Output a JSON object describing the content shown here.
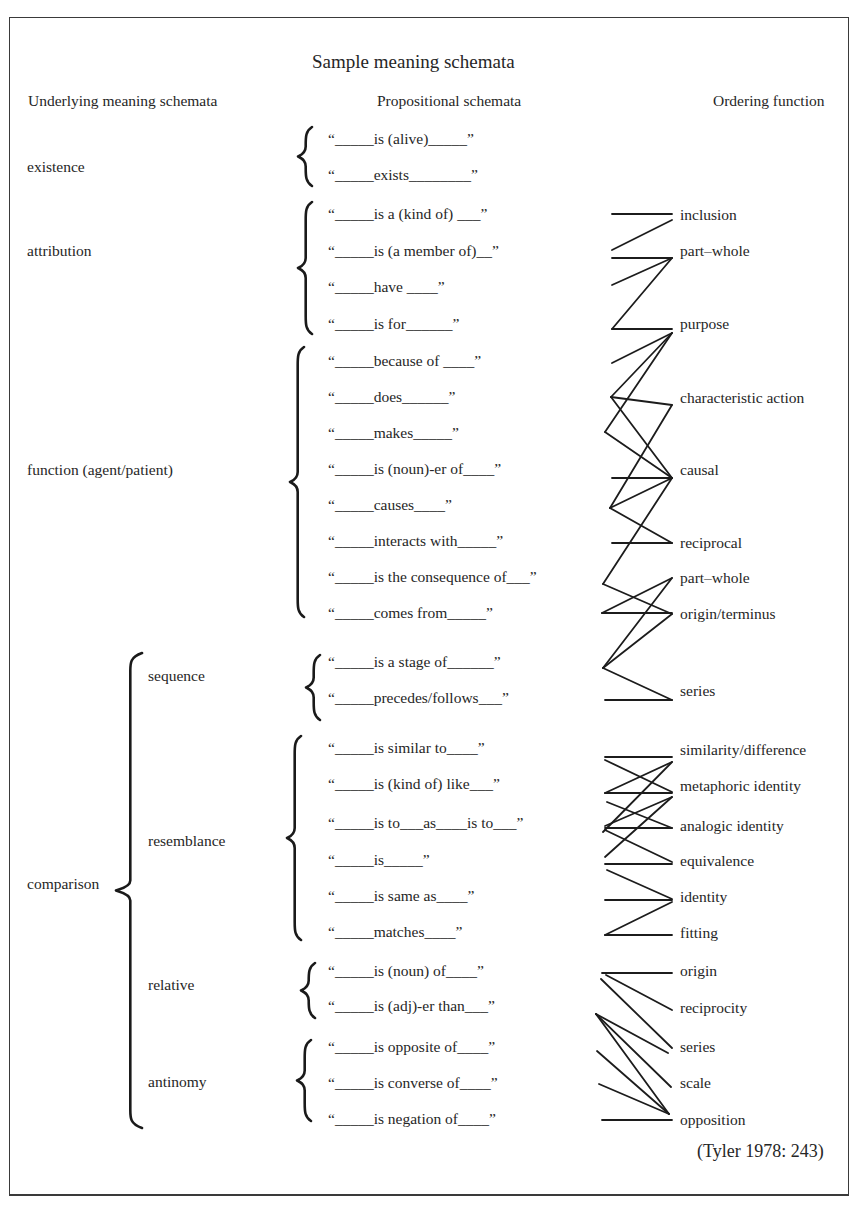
{
  "title": "Sample meaning schemata",
  "headers": {
    "underlying": "Underlying meaning schemata",
    "propositional": "Propositional schemata",
    "ordering": "Ordering function"
  },
  "underlying": [
    {
      "label": "existence",
      "x": 27,
      "y": 158
    },
    {
      "label": "attribution",
      "x": 27,
      "y": 242
    },
    {
      "label": "function (agent/patient)",
      "x": 27,
      "y": 461
    },
    {
      "label": "comparison",
      "x": 27,
      "y": 875
    },
    {
      "label": "sequence",
      "x": 148,
      "y": 667
    },
    {
      "label": "resemblance",
      "x": 148,
      "y": 832
    },
    {
      "label": "relative",
      "x": 148,
      "y": 976
    },
    {
      "label": "antinomy",
      "x": 148,
      "y": 1073
    }
  ],
  "propositional": [
    {
      "text": "“_____is (alive)_____”",
      "y": 130
    },
    {
      "text": "“_____exists________”",
      "y": 166
    },
    {
      "text": "“_____is a (kind of) ___”",
      "y": 205
    },
    {
      "text": "“_____is (a member of)__”",
      "y": 242
    },
    {
      "text": "“_____have ____”",
      "y": 278
    },
    {
      "text": "“_____is for______”",
      "y": 315
    },
    {
      "text": "“_____because of ____”",
      "y": 352
    },
    {
      "text": "“_____does______”",
      "y": 388
    },
    {
      "text": "“_____makes_____”",
      "y": 424
    },
    {
      "text": "“_____is (noun)-er of____”",
      "y": 460
    },
    {
      "text": "“_____causes____”",
      "y": 496
    },
    {
      "text": "“_____interacts with_____”",
      "y": 532
    },
    {
      "text": "“_____is the consequence of___”",
      "y": 568
    },
    {
      "text": "“_____comes from_____”",
      "y": 604
    },
    {
      "text": "“_____is a stage of______”",
      "y": 653
    },
    {
      "text": "“_____precedes/follows___”",
      "y": 689
    },
    {
      "text": "“_____is similar to____”",
      "y": 739
    },
    {
      "text": "“_____is (kind of) like___”",
      "y": 775
    },
    {
      "text": "“_____is to___as____is to___”",
      "y": 814
    },
    {
      "text": "“_____is_____”",
      "y": 851
    },
    {
      "text": "“_____is same as____”",
      "y": 887
    },
    {
      "text": "“_____matches____”",
      "y": 923
    },
    {
      "text": "“_____is (noun) of____”",
      "y": 962
    },
    {
      "text": "“_____is (adj)-er than___”",
      "y": 997
    },
    {
      "text": "“_____is opposite of____”",
      "y": 1038
    },
    {
      "text": "“_____is converse of____”",
      "y": 1074
    },
    {
      "text": "“_____is negation of____”",
      "y": 1110
    }
  ],
  "ordering": [
    {
      "label": "inclusion",
      "y": 206
    },
    {
      "label": "part–whole",
      "y": 242
    },
    {
      "label": "purpose",
      "y": 315
    },
    {
      "label": "characteristic action",
      "y": 389
    },
    {
      "label": "causal",
      "y": 461
    },
    {
      "label": "reciprocal",
      "y": 534
    },
    {
      "label": "part–whole",
      "y": 569
    },
    {
      "label": "origin/terminus",
      "y": 605
    },
    {
      "label": "series",
      "y": 682
    },
    {
      "label": "similarity/difference",
      "y": 741
    },
    {
      "label": "metaphoric identity",
      "y": 777
    },
    {
      "label": "analogic identity",
      "y": 817
    },
    {
      "label": "equivalence",
      "y": 852
    },
    {
      "label": "identity",
      "y": 888
    },
    {
      "label": "fitting",
      "y": 924
    },
    {
      "label": "origin",
      "y": 962
    },
    {
      "label": "reciprocity",
      "y": 999
    },
    {
      "label": "series",
      "y": 1038
    },
    {
      "label": "scale",
      "y": 1074
    },
    {
      "label": "opposition",
      "y": 1111
    }
  ],
  "braces": [
    {
      "name": "existence",
      "x": 298,
      "top": 127,
      "bottom": 186
    },
    {
      "name": "attribution",
      "x": 298,
      "top": 202,
      "bottom": 334
    },
    {
      "name": "function",
      "x": 290,
      "top": 347,
      "bottom": 617
    },
    {
      "name": "comparison",
      "x": 116,
      "top": 653,
      "bottom": 1128
    },
    {
      "name": "sequence",
      "x": 306,
      "top": 655,
      "bottom": 720
    },
    {
      "name": "resemblance",
      "x": 287,
      "top": 736,
      "bottom": 940
    },
    {
      "name": "relative",
      "x": 301,
      "top": 963,
      "bottom": 1018
    },
    {
      "name": "antinomy",
      "x": 297,
      "top": 1040,
      "bottom": 1121
    }
  ],
  "links": [
    [
      612,
      214,
      672,
      214
    ],
    [
      612,
      250,
      672,
      220
    ],
    [
      612,
      258,
      672,
      258
    ],
    [
      612,
      285,
      672,
      258
    ],
    [
      612,
      329,
      672,
      258
    ],
    [
      612,
      329,
      672,
      329
    ],
    [
      612,
      363,
      672,
      333
    ],
    [
      611,
      397,
      672,
      333
    ],
    [
      611,
      397,
      672,
      405
    ],
    [
      611,
      397,
      672,
      478
    ],
    [
      605,
      432,
      672,
      333
    ],
    [
      605,
      432,
      672,
      478
    ],
    [
      612,
      478,
      672,
      478
    ],
    [
      610,
      508,
      672,
      405
    ],
    [
      610,
      508,
      672,
      478
    ],
    [
      610,
      508,
      672,
      543
    ],
    [
      612,
      543,
      672,
      543
    ],
    [
      603,
      584,
      672,
      478
    ],
    [
      603,
      584,
      672,
      614
    ],
    [
      602,
      613,
      672,
      613
    ],
    [
      602,
      613,
      672,
      578
    ],
    [
      603,
      668,
      672,
      578
    ],
    [
      603,
      668,
      672,
      614
    ],
    [
      603,
      668,
      672,
      700
    ],
    [
      605,
      700,
      672,
      700
    ],
    [
      605,
      757,
      672,
      757
    ],
    [
      605,
      760,
      672,
      792
    ],
    [
      605,
      793,
      672,
      793
    ],
    [
      605,
      793,
      672,
      762
    ],
    [
      607,
      802,
      672,
      828
    ],
    [
      603,
      832,
      672,
      762
    ],
    [
      605,
      828,
      672,
      828
    ],
    [
      605,
      826,
      672,
      797
    ],
    [
      605,
      830,
      672,
      862
    ],
    [
      605,
      857,
      672,
      797
    ],
    [
      605,
      864,
      672,
      864
    ],
    [
      607,
      870,
      672,
      899
    ],
    [
      605,
      900,
      672,
      900
    ],
    [
      605,
      935,
      672,
      935
    ],
    [
      605,
      935,
      672,
      902
    ],
    [
      602,
      973,
      672,
      973
    ],
    [
      606,
      975,
      672,
      1010
    ],
    [
      601,
      979,
      672,
      1048
    ],
    [
      596,
      1014,
      668,
      1053
    ],
    [
      596,
      1014,
      671,
      1087
    ],
    [
      596,
      1014,
      669,
      1114
    ],
    [
      597,
      1051,
      669,
      1114
    ],
    [
      599,
      1084,
      669,
      1114
    ],
    [
      602,
      1120,
      672,
      1120
    ]
  ],
  "citation": "(Tyler 1978: 243)"
}
